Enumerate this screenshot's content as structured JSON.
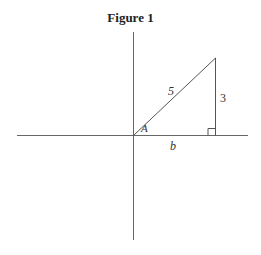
{
  "figure": {
    "title": "Figure 1",
    "labels": {
      "hypotenuse": "5",
      "opposite": "3",
      "adjacent": "b",
      "angle": "A"
    },
    "colors": {
      "line": "#555555",
      "text": "#333333"
    }
  }
}
